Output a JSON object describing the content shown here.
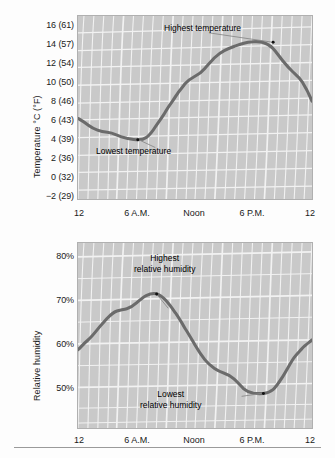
{
  "figure": {
    "background_color": "#fdfdfd",
    "plot_background_color": "#c9c9c9",
    "grid_color": "#f2f2f2",
    "curve_color": "#6b6b6b"
  },
  "chart_data": [
    {
      "type": "line",
      "title": "",
      "xlabel": "",
      "ylabel": "Temperature °C (°F)",
      "grid": true,
      "legend": "none",
      "xlim": [
        0,
        24
      ],
      "ylim": [
        -3,
        17
      ],
      "xticks": [
        0,
        6,
        12,
        18,
        24
      ],
      "xtick_labels": [
        "12",
        "6 A.M.",
        "Noon",
        "6 P.M.",
        "12"
      ],
      "yticks": [
        -2,
        0,
        2,
        4,
        6,
        8,
        10,
        12,
        14,
        16
      ],
      "ytick_labels": [
        "−2 (29)",
        "0 (32)",
        "2 (36)",
        "4 (39)",
        "6 (43)",
        "8 (46)",
        "10 (50)",
        "12 (54)",
        "14 (57)",
        "16 (61)"
      ],
      "x": [
        0,
        1,
        2,
        3,
        4,
        5,
        6,
        7,
        8,
        9,
        10,
        11,
        12,
        13,
        14,
        15,
        16,
        17,
        18,
        19,
        20,
        21,
        22,
        23,
        24
      ],
      "values": [
        5.8,
        5.4,
        4.3,
        4.1,
        3.8,
        3.4,
        3.1,
        3.3,
        4.3,
        5.7,
        7.0,
        8.2,
        9.2,
        9.6,
        10.5,
        11.2,
        11.7,
        12.0,
        12.0,
        11.6,
        10.6,
        9.3,
        8.3,
        7.1,
        5.8
      ],
      "annotations": [
        {
          "text": "Highest temperature",
          "point_x": 17.2,
          "point_y": 12.0
        },
        {
          "text": "Lowest temperature",
          "point_x": 6.1,
          "point_y": 3.1
        }
      ]
    },
    {
      "type": "line",
      "title": "",
      "xlabel": "",
      "ylabel": "Relative humidity",
      "grid": true,
      "legend": "none",
      "xlim": [
        0,
        24
      ],
      "ylim": [
        45,
        84
      ],
      "xticks": [
        0,
        6,
        12,
        18,
        24
      ],
      "xtick_labels": [
        "12",
        "6 A.M.",
        "Noon",
        "6 P.M.",
        "12"
      ],
      "yticks": [
        50,
        60,
        70,
        80
      ],
      "ytick_labels": [
        "50%",
        "60%",
        "70%",
        "80%"
      ],
      "x": [
        0,
        1,
        2,
        3,
        4,
        5,
        6,
        7,
        8,
        9,
        10,
        11,
        12,
        13,
        14,
        15,
        16,
        17,
        18,
        19,
        20,
        21,
        22,
        23,
        24
      ],
      "values": [
        61.5,
        63.5,
        65.8,
        67.3,
        67.8,
        69.4,
        70.8,
        70.2,
        68.2,
        65.6,
        62.5,
        59.5,
        56.5,
        54.0,
        52.8,
        52.0,
        50.3,
        48.8,
        48.5,
        48.8,
        50.5,
        54.0,
        58.5,
        62.5,
        64.5
      ],
      "annotations": [
        {
          "text": "Highest\nrelative humidity",
          "point_x": 6.3,
          "point_y": 70.8
        },
        {
          "text": "Lowest\nrelative humidity",
          "point_x": 18.2,
          "point_y": 48.5
        }
      ]
    }
  ]
}
